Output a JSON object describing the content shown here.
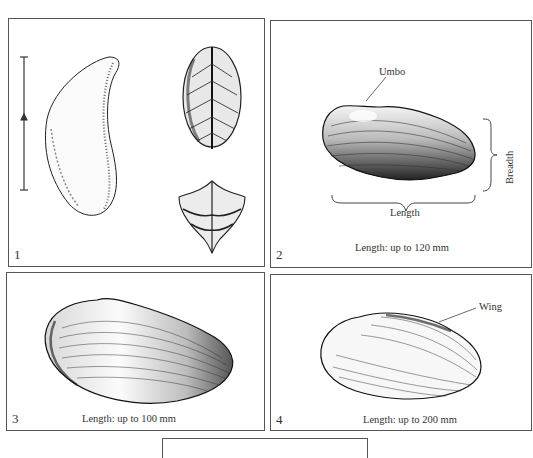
{
  "figure": {
    "panels": [
      {
        "number": "1",
        "content": "Shell views: side profile with scale bar, top view (leaf-shaped), end view (heart-shaped)",
        "scale_bar": true
      },
      {
        "number": "2",
        "labels": {
          "umbo": "Umbo",
          "breadth": "Breadth",
          "length": "Length"
        },
        "caption": "Length: up to 120 mm"
      },
      {
        "number": "3",
        "caption": "Length: up to 100 mm"
      },
      {
        "number": "4",
        "labels": {
          "wing": "Wing"
        },
        "caption": "Length: up to 200 mm"
      },
      {
        "number": "",
        "content": "Empty panel (partially visible, cropped at bottom)"
      }
    ]
  },
  "colors": {
    "ink": "#222222",
    "border": "#555555",
    "paper": "#ffffff"
  }
}
